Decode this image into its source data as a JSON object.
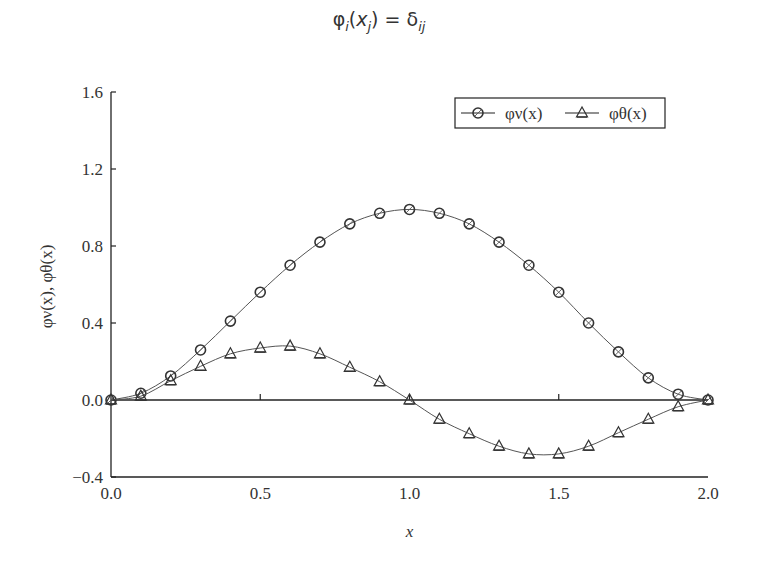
{
  "header": {
    "formula_phi": "φ",
    "formula_i": "i",
    "formula_open": "(",
    "formula_x": "x",
    "formula_j": "j",
    "formula_close": ") = δ",
    "formula_ij": "ij"
  },
  "chart_data": {
    "type": "line",
    "title": "φi(xj) = δij",
    "xlabel": "x",
    "ylabel": "φν(x), φθ(x)",
    "xlim": [
      0.0,
      2.0
    ],
    "ylim": [
      -0.4,
      1.6
    ],
    "xticks": [
      "0.0",
      "0.5",
      "1.0",
      "1.5",
      "2.0"
    ],
    "yticks": [
      "-0.4",
      "0.0",
      "0.4",
      "0.8",
      "1.2",
      "1.6"
    ],
    "grid": false,
    "legend_position": "upper right",
    "x": [
      0.0,
      0.1,
      0.2,
      0.3,
      0.4,
      0.5,
      0.6,
      0.7,
      0.8,
      0.9,
      1.0,
      1.1,
      1.2,
      1.3,
      1.4,
      1.5,
      1.6,
      1.7,
      1.8,
      1.9,
      2.0
    ],
    "series": [
      {
        "name": "φν(x)",
        "marker": "circle",
        "values": [
          0.0,
          0.035,
          0.125,
          0.26,
          0.41,
          0.56,
          0.7,
          0.82,
          0.915,
          0.97,
          0.99,
          0.97,
          0.915,
          0.82,
          0.7,
          0.56,
          0.4,
          0.25,
          0.115,
          0.03,
          0.0
        ]
      },
      {
        "name": "φθ(x)",
        "marker": "triangle",
        "values": [
          0.0,
          0.02,
          0.1,
          0.175,
          0.24,
          0.27,
          0.28,
          0.24,
          0.17,
          0.095,
          0.0,
          -0.1,
          -0.175,
          -0.24,
          -0.28,
          -0.28,
          -0.24,
          -0.17,
          -0.1,
          -0.035,
          0.0
        ]
      }
    ],
    "reference_line": {
      "y": 0.0
    }
  },
  "legend": {
    "series1_label": "φν(x)",
    "series2_label": "φθ(x)"
  },
  "colors": {
    "line": "#555555",
    "axis": "#222222",
    "marker": "#333333"
  }
}
